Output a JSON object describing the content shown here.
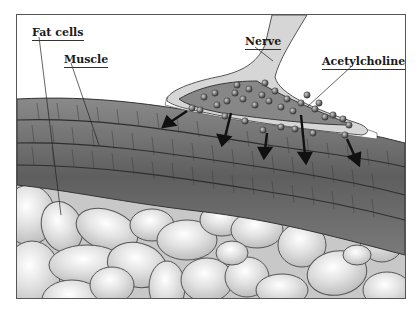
{
  "diagram": {
    "type": "anatomical-illustration",
    "labels": [
      {
        "id": "fat-cells",
        "text": "Fat cells"
      },
      {
        "id": "muscle",
        "text": "Muscle"
      },
      {
        "id": "nerve",
        "text": "Nerve"
      },
      {
        "id": "acetylcholine",
        "text": "Acetylcholine"
      }
    ],
    "colors": {
      "muscle": "#6e6e6e",
      "muscle_dark": "#4a4a4a",
      "nerve_sheath": "#d8d8d8",
      "nerve_terminal": "#8a8a8a",
      "vesicle": "#5a5a5a",
      "fat_cell": "#dcdcdc",
      "fat_cell_edge": "#555555",
      "arrow": "#111111"
    }
  }
}
